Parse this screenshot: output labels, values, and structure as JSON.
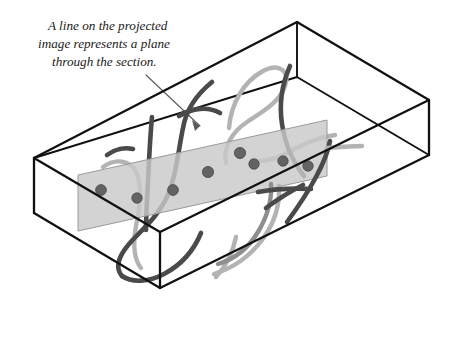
{
  "figure": {
    "caption": {
      "lines": [
        "A line on the projected",
        "image represents a plane",
        "through the section."
      ],
      "full_text": "A line on the projected image represents a plane through the section.",
      "anchor": {
        "x": 48,
        "y": 30
      },
      "line_height": 18,
      "font_size": 13.2,
      "color": "#1a1a1a"
    },
    "leader": {
      "label": "leader-line",
      "from": {
        "x": 146,
        "y": 75
      },
      "to": {
        "x": 200,
        "y": 126
      },
      "color": "#5a5a5a"
    },
    "colors": {
      "background": "#ffffff",
      "box_edge": "#111111",
      "plane_fill": "#c9c9c9",
      "plane_stroke": "#9a9a9a",
      "fiber_dark": "#4a4a4a",
      "fiber_mid": "#8e8e8e",
      "fiber_light": "#b3b3b3",
      "dot_fill": "#636363"
    },
    "box": {
      "label": "wireframe-box",
      "vertices": {
        "top_back": {
          "x": 297,
          "y": 22
        },
        "top_left": {
          "x": 34,
          "y": 158
        },
        "top_right": {
          "x": 429,
          "y": 100
        },
        "top_front": {
          "x": 160,
          "y": 232
        },
        "bottom_left": {
          "x": 34,
          "y": 213
        },
        "bottom_front": {
          "x": 160,
          "y": 288
        },
        "bottom_right": {
          "x": 429,
          "y": 155
        },
        "bottom_back": {
          "x": 297,
          "y": 77
        }
      },
      "edge_width": 2.3
    },
    "plane": {
      "label": "section-plane",
      "corners": [
        {
          "x": 78,
          "y": 175
        },
        {
          "x": 327,
          "y": 120
        },
        {
          "x": 327,
          "y": 176
        },
        {
          "x": 78,
          "y": 231
        }
      ],
      "fill": "#c9c9c9",
      "opacity": 0.82
    },
    "intersection_dots": [
      {
        "id": 1,
        "x": 101,
        "y": 190,
        "r": 5.4
      },
      {
        "id": 2,
        "x": 137,
        "y": 198,
        "r": 5.2
      },
      {
        "id": 3,
        "x": 173,
        "y": 190,
        "r": 5.4
      },
      {
        "id": 4,
        "x": 208,
        "y": 172,
        "r": 5.6
      },
      {
        "id": 5,
        "x": 240,
        "y": 153,
        "r": 5.6
      },
      {
        "id": 6,
        "x": 254,
        "y": 164,
        "r": 5.2
      },
      {
        "id": 7,
        "x": 283,
        "y": 161,
        "r": 5.2
      },
      {
        "id": 8,
        "x": 308,
        "y": 166,
        "r": 5.2
      }
    ],
    "fibers": [
      {
        "id": "f-light-loop-upper",
        "shade": "light",
        "path": "M 229 128 C 231 104, 243 82, 263 71 C 280 62, 290 72, 285 86 C 280 102, 262 112, 247 122 C 232 132, 223 147, 226 163"
      },
      {
        "id": "f-light-hook-left",
        "shade": "light",
        "path": "M 103 167 C 115 158, 130 160, 136 172 C 143 186, 140 206, 136 226 C 133 243, 133 258, 141 268"
      },
      {
        "id": "f-light-long-right",
        "shade": "light",
        "path": "M 335 135 C 320 137, 305 143, 291 151 C 277 159, 264 163, 252 160"
      },
      {
        "id": "f-light-diag-low",
        "shade": "light",
        "path": "M 214 274 C 233 268, 250 256, 262 240 C 274 224, 280 205, 279 186"
      },
      {
        "id": "f-light-tail-br",
        "shade": "light",
        "path": "M 216 277 C 226 266, 233 252, 236 237"
      },
      {
        "id": "f-mid-arc-lowright",
        "shade": "mid",
        "path": "M 218 264 C 235 259, 249 247, 258 232 C 267 217, 272 200, 271 184"
      },
      {
        "id": "f-dark-bigS",
        "shade": "dark",
        "path": "M 212 82 C 196 95, 186 110, 183 128 C 178 152, 176 178, 166 199 C 156 219, 140 231, 129 244 C 118 257, 115 268, 122 276"
      },
      {
        "id": "f-dark-hook-bottom",
        "shade": "dark",
        "path": "M 122 276 C 132 283, 149 282, 164 274 C 181 265, 194 250, 201 233"
      },
      {
        "id": "f-dark-right-arc",
        "shade": "dark",
        "path": "M 290 66 C 282 84, 279 104, 282 124 C 285 144, 293 162, 304 176"
      },
      {
        "id": "f-dark-vert-left",
        "shade": "dark",
        "path": "M 152 117 C 150 138, 149 160, 148 182 C 147 200, 146 216, 146 230"
      },
      {
        "id": "f-dark-cross-right",
        "shade": "dark",
        "path": "M 287 222 C 298 207, 308 192, 316 177 C 323 164, 328 152, 330 141"
      },
      {
        "id": "f-dark-slash-lower",
        "shade": "dark",
        "path": "M 266 208 C 278 199, 291 191, 303 185"
      },
      {
        "id": "f-dark-horiz-right",
        "shade": "dark",
        "path": "M 258 192 C 275 189, 292 188, 311 189"
      },
      {
        "id": "f-dark-tail-right",
        "shade": "dark",
        "path": "M 261 203 C 274 197, 288 192, 303 189"
      },
      {
        "id": "f-dark-curve-upper-mid",
        "shade": "dark",
        "path": "M 179 116 C 192 108, 208 106, 220 113"
      },
      {
        "id": "f-dark-stub-left",
        "shade": "dark",
        "path": "M 107 155 C 115 149, 125 147, 133 149"
      }
    ]
  }
}
